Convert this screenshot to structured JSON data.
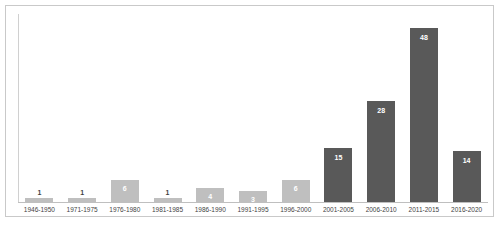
{
  "chart_data": {
    "type": "bar",
    "title": "",
    "subtitle": "",
    "xlabel": "",
    "ylabel": "",
    "grid": false,
    "legend": "none",
    "ylim": [
      0,
      52
    ],
    "categories": [
      "1946-1950",
      "1971-1975",
      "1976-1980",
      "1981-1985",
      "1986-1990",
      "1991-1995",
      "1996-2000",
      "2001-2005",
      "2006-2010",
      "2011-2015",
      "2016-2020"
    ],
    "values": [
      1,
      1,
      6,
      1,
      4,
      3,
      6,
      15,
      28,
      48,
      14
    ],
    "value_labels": [
      "1",
      "1",
      "6",
      "1",
      "4",
      "3",
      "6",
      "15",
      "28",
      "48",
      "14"
    ],
    "bar_colors": [
      "#bfbfbf",
      "#bfbfbf",
      "#bfbfbf",
      "#bfbfbf",
      "#bfbfbf",
      "#bfbfbf",
      "#bfbfbf",
      "#595959",
      "#595959",
      "#595959",
      "#595959"
    ],
    "label_colors": [
      "#3f3f3f",
      "#3f3f3f",
      "#ffffff",
      "#3f3f3f",
      "#ffffff",
      "#ffffff",
      "#ffffff",
      "#ffffff",
      "#ffffff",
      "#ffffff",
      "#ffffff"
    ],
    "label_placement": [
      "above",
      "above",
      "inside",
      "above",
      "inside",
      "inside",
      "inside",
      "inside",
      "inside",
      "inside",
      "inside"
    ],
    "colors": {
      "light_bar": "#bfbfbf",
      "dark_bar": "#595959",
      "axis": "#bfbfbf",
      "border": "#c9c9c9",
      "background": "#ffffff",
      "tick_label": "#3f3f3f"
    }
  }
}
